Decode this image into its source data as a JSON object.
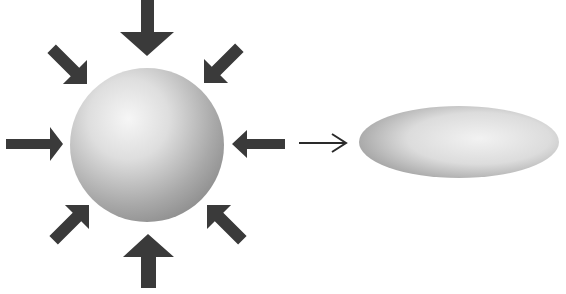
{
  "diagram": {
    "colors": {
      "background": "#ffffff",
      "arrow": "#3a3a3a",
      "thin_arrow": "#2a2a2a",
      "sphere_light": "#f4f4f4",
      "sphere_dark": "#8e8e8e"
    },
    "sphere": {
      "cx": 147,
      "cy": 145,
      "r": 77
    },
    "ellipsoid": {
      "cx": 459,
      "cy": 142,
      "rx": 100,
      "ry": 36
    },
    "compression_arrows": [
      {
        "name": "top",
        "direction": "down"
      },
      {
        "name": "top-right",
        "direction": "down-left"
      },
      {
        "name": "right",
        "direction": "left"
      },
      {
        "name": "bottom-right",
        "direction": "up-left"
      },
      {
        "name": "bottom",
        "direction": "up"
      },
      {
        "name": "bottom-left",
        "direction": "up-right"
      },
      {
        "name": "left",
        "direction": "right"
      },
      {
        "name": "top-left",
        "direction": "down-right"
      }
    ],
    "transition_arrow": {
      "direction": "right"
    }
  }
}
